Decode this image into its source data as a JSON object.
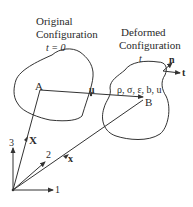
{
  "diagram": {
    "original": {
      "title_line1": "Original",
      "title_line2": "Configuration",
      "time_label": "t = 0",
      "point": "A"
    },
    "deformed": {
      "title_line1": "Deformed",
      "title_line2": "Configuration",
      "time_label": "t",
      "point": "B",
      "fields": "ρ, σ, ε, b, u",
      "normal_label": "n",
      "traction_label": "t"
    },
    "displacement_label": "u",
    "axes": {
      "axis1": "1",
      "axis2": "2",
      "axis3": "3"
    },
    "position_vectors": {
      "reference": "X",
      "current": "x"
    }
  }
}
